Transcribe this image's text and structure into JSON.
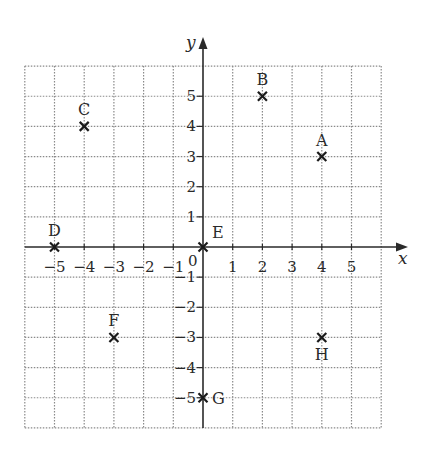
{
  "chart_data": {
    "type": "scatter",
    "title": "",
    "xlabel": "x",
    "ylabel": "y",
    "xlim": [
      -6,
      6
    ],
    "ylim": [
      -6,
      6
    ],
    "grid": true,
    "grid_style": "dotted",
    "origin_label": "0",
    "x_ticks": [
      -5,
      -4,
      -3,
      -2,
      -1,
      1,
      2,
      3,
      4,
      5
    ],
    "y_ticks": [
      -5,
      -4,
      -3,
      -2,
      -1,
      1,
      2,
      3,
      4,
      5
    ],
    "x_tick_labels": [
      "−5",
      "−4",
      "−3",
      "−2",
      "−1",
      "1",
      "2",
      "3",
      "4",
      "5"
    ],
    "y_tick_labels": [
      "−5",
      "−4",
      "−3",
      "−2",
      "−1",
      "1",
      "2",
      "3",
      "4",
      "5"
    ],
    "marker": "x",
    "points": [
      {
        "label": "A",
        "x": 4,
        "y": 3,
        "label_pos": "above"
      },
      {
        "label": "B",
        "x": 2,
        "y": 5,
        "label_pos": "above"
      },
      {
        "label": "C",
        "x": -4,
        "y": 4,
        "label_pos": "above"
      },
      {
        "label": "D",
        "x": -5,
        "y": 0,
        "label_pos": "above"
      },
      {
        "label": "E",
        "x": 0,
        "y": 0,
        "label_pos": "above-right"
      },
      {
        "label": "F",
        "x": -3,
        "y": -3,
        "label_pos": "above"
      },
      {
        "label": "G",
        "x": 0,
        "y": -5,
        "label_pos": "right"
      },
      {
        "label": "H",
        "x": 4,
        "y": -3,
        "label_pos": "below"
      }
    ]
  },
  "style": {
    "grid_color": "#8a8a8a",
    "axis_color": "#2a2a2a",
    "marker_color": "#1a1a1a",
    "text_color": "#2a2a2a",
    "background": "#ffffff"
  }
}
